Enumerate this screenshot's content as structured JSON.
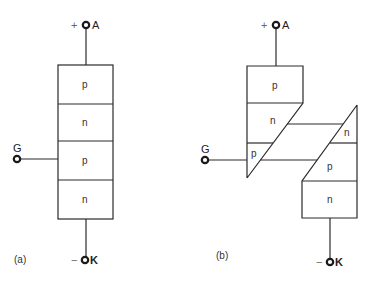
{
  "figure": {
    "panels": [
      {
        "id": "a",
        "caption": "(a)",
        "layers": [
          {
            "type": "p"
          },
          {
            "type": "n"
          },
          {
            "type": "p"
          },
          {
            "type": "n"
          }
        ],
        "terminals": {
          "anode": {
            "sign": "+",
            "label": "A"
          },
          "gate": {
            "label": "G"
          },
          "cathode": {
            "sign": "−",
            "label": "K"
          }
        }
      },
      {
        "id": "b",
        "caption": "(b)",
        "regions": [
          {
            "type": "p",
            "position": "upper-left top"
          },
          {
            "type": "n",
            "position": "upper-left middle"
          },
          {
            "type": "p",
            "position": "upper-left bottom (gate)"
          },
          {
            "type": "n",
            "position": "lower-right top"
          },
          {
            "type": "p",
            "position": "lower-right middle"
          },
          {
            "type": "n",
            "position": "lower-right bottom"
          }
        ],
        "terminals": {
          "anode": {
            "sign": "+",
            "label": "A"
          },
          "gate": {
            "label": "G"
          },
          "cathode": {
            "sign": "−",
            "label": "K"
          }
        }
      }
    ],
    "colors": {
      "line": "#2a2a2a",
      "background": "#ffffff"
    }
  }
}
